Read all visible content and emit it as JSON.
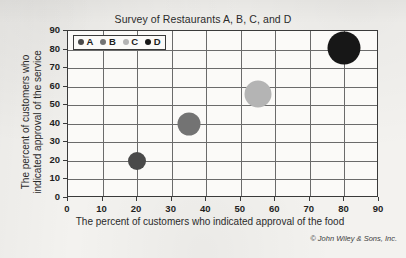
{
  "chart_data": {
    "type": "scatter",
    "title": "Survey of Restaurants A, B, C, and D",
    "xlabel": "The percent of customers who indicated approval of the food",
    "ylabel_line1": "The percent of customers who",
    "ylabel_line2": "indicated approval of the service",
    "xlim": [
      0,
      90
    ],
    "ylim": [
      0,
      90
    ],
    "xticks": [
      "0",
      "10",
      "20",
      "30",
      "40",
      "50",
      "60",
      "70",
      "80",
      "90"
    ],
    "yticks": [
      "0",
      "10",
      "20",
      "30",
      "40",
      "50",
      "60",
      "70",
      "80",
      "90"
    ],
    "xtick_values": [
      0,
      10,
      20,
      30,
      40,
      50,
      60,
      70,
      80,
      90
    ],
    "ytick_values": [
      0,
      10,
      20,
      30,
      40,
      50,
      60,
      70,
      80,
      90
    ],
    "grid": true,
    "legend_position": "top-left-inside",
    "points": [
      {
        "name": "A",
        "x": 20,
        "y": 20,
        "size_px": 18,
        "color": "#4a4a4a"
      },
      {
        "name": "B",
        "x": 35,
        "y": 40,
        "size_px": 23,
        "color": "#737373"
      },
      {
        "name": "C",
        "x": 55,
        "y": 56,
        "size_px": 27,
        "color": "#b4b4b4"
      },
      {
        "name": "D",
        "x": 80,
        "y": 81,
        "size_px": 33,
        "color": "#171717"
      }
    ],
    "series": [
      {
        "name": "A",
        "x": [
          20
        ],
        "y": [
          20
        ]
      },
      {
        "name": "B",
        "x": [
          35
        ],
        "y": [
          40
        ]
      },
      {
        "name": "C",
        "x": [
          55
        ],
        "y": [
          56
        ]
      },
      {
        "name": "D",
        "x": [
          80
        ],
        "y": [
          81
        ]
      }
    ],
    "legend": [
      {
        "label": "A",
        "color": "#4a4a4a"
      },
      {
        "label": "B",
        "color": "#737373"
      },
      {
        "label": "C",
        "color": "#b4b4b4"
      },
      {
        "label": "D",
        "color": "#171717"
      }
    ]
  },
  "credit": "© John Wiley & Sons, Inc."
}
